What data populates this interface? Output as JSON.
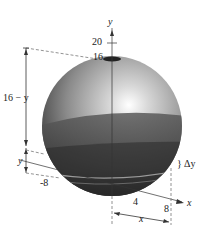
{
  "figure": {
    "axes": {
      "y_label": "y",
      "x_label": "x",
      "y_ticks": [
        "20",
        "16"
      ],
      "x_ticks": [
        "4",
        "8"
      ],
      "neg_tick": "-8"
    },
    "annotations": {
      "height_above": "16 − y",
      "height_below": "y",
      "slice_thickness": "Δy",
      "radius_label": "x"
    },
    "colors": {
      "sphere_light": "#d9d9d9",
      "sphere_mid": "#8c8c8c",
      "liquid_dark": "#3a3a3a",
      "line": "#333333",
      "dashed": "#777777"
    }
  }
}
